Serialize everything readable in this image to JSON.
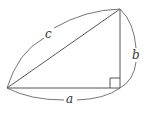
{
  "diagram": {
    "labels": {
      "hypotenuse": "c",
      "vertical_leg": "b",
      "horizontal_leg": "a"
    },
    "colors": {
      "stroke": "#555555",
      "text": "#333333",
      "background": "#ffffff"
    }
  }
}
